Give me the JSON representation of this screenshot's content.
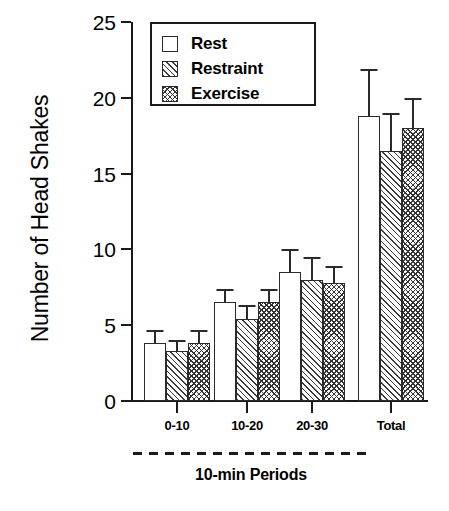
{
  "chart_data": {
    "type": "bar",
    "title": "",
    "xlabel": "10-min Periods",
    "ylabel": "Number of Head Shakes",
    "categories": [
      "0-10",
      "10-20",
      "20-30",
      "Total"
    ],
    "ylim": [
      0,
      25
    ],
    "yticks": [
      0,
      5,
      10,
      15,
      20,
      25
    ],
    "grid": false,
    "legend_position": "top-left-inside",
    "series": [
      {
        "name": "Rest",
        "pattern": "open",
        "values": [
          3.8,
          6.5,
          8.5,
          18.8
        ],
        "errors": [
          0.9,
          0.9,
          1.5,
          3.1
        ]
      },
      {
        "name": "Restraint",
        "pattern": "diagonal-hatch",
        "values": [
          3.3,
          5.4,
          8.0,
          16.5
        ],
        "errors": [
          0.7,
          0.9,
          1.5,
          2.5
        ]
      },
      {
        "name": "Exercise",
        "pattern": "crosshatch",
        "values": [
          3.8,
          6.5,
          7.8,
          18.0
        ],
        "errors": [
          0.9,
          0.9,
          1.1,
          2.0
        ]
      }
    ],
    "annotations": [
      "dashed bracket spanning 0-10, 10-20 and 20-30 groups labelled 10-min Periods"
    ],
    "colors": {
      "axis": "#1a1a1a",
      "bar_edge": "#2a2a2a",
      "bar_fill": "#ffffff",
      "hatch": "#333333"
    }
  },
  "axis": {
    "y_tick_labels": [
      "25",
      "20",
      "15",
      "10",
      "5",
      "0"
    ],
    "x_tick_labels": [
      "0-10",
      "10-20",
      "20-30",
      "Total"
    ],
    "y_title": "Number of Head Shakes",
    "x_bracket_label": "10-min Periods"
  },
  "legend": {
    "items": [
      {
        "label": "Rest"
      },
      {
        "label": "Restraint"
      },
      {
        "label": "Exercise"
      }
    ]
  }
}
